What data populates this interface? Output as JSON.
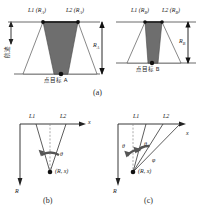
{
  "figure": {
    "type": "technical-diagram",
    "caption_a": "(a)",
    "caption_b": "(b)",
    "caption_c": "(c)"
  },
  "panel_a": {
    "left_scene": {
      "beam1_label": "L1 (R",
      "beam1_sub": "A",
      "beam1_tail": ")",
      "beam2_label": "L2 (R",
      "beam2_sub": "A",
      "beam2_tail": ")",
      "track_label": "航迹",
      "target_label": "点目标 A",
      "range_label": "R",
      "range_sub": "A"
    },
    "right_scene": {
      "beam1_label": "L1 (R",
      "beam1_sub": "B",
      "beam1_tail": ")",
      "beam2_label": "L2 (R",
      "beam2_sub": "B",
      "beam2_tail": ")",
      "target_label": "点目标 B",
      "range_label": "R",
      "range_sub": "B"
    }
  },
  "panel_b": {
    "axis_x": "x",
    "axis_r": "R",
    "line1_label": "L1",
    "line2_label": "L2",
    "angle_label": "θ",
    "point_label": "(R, x)"
  },
  "panel_c": {
    "axis_x": "x",
    "axis_r": "R",
    "line1_label": "L1",
    "line2_label": "L2",
    "angle_label_1": "θ",
    "angle_label_2": "θ",
    "angle_label_3": "φ",
    "point_label": "(R, x)"
  },
  "colors": {
    "stroke": "#333333",
    "overlap_fill": "#6e6e6e",
    "beam_fill": "#ffffff",
    "light_fill": "#bdbdbd",
    "background": "#ffffff"
  }
}
